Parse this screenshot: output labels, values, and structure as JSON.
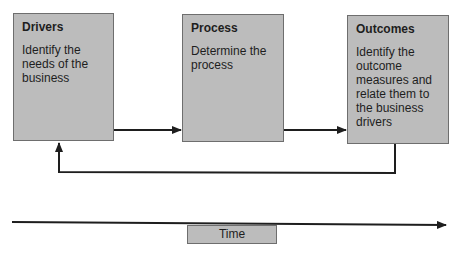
{
  "diagram": {
    "boxes": [
      {
        "id": "drivers",
        "title": "Drivers",
        "description": "Identify the needs of the business"
      },
      {
        "id": "process",
        "title": "Process",
        "description": "Determine the process"
      },
      {
        "id": "outcomes",
        "title": "Outcomes",
        "description": "Identify the outcome measures and relate them to the business drivers"
      }
    ],
    "arrows": [
      {
        "from": "drivers",
        "to": "process"
      },
      {
        "from": "process",
        "to": "outcomes"
      },
      {
        "from": "outcomes",
        "to": "drivers",
        "type": "feedback"
      }
    ],
    "timeline": {
      "label": "Time"
    },
    "colors": {
      "box_fill": "#bcbcbc",
      "box_border": "#6e6e6e",
      "line": "#1e1e1e"
    }
  }
}
